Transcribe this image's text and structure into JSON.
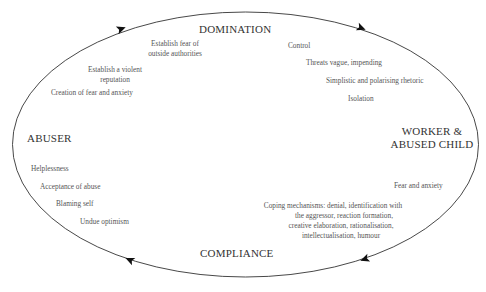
{
  "diagram": {
    "nodes": {
      "domination": "DOMINATION",
      "abuser": "ABUSER",
      "worker": [
        "WORKER &",
        "ABUSED CHILD"
      ],
      "compliance": "COMPLIANCE"
    },
    "abuser_domination_items": [
      [
        "Establish fear of",
        "outside authorities"
      ],
      [
        "Establish a violent",
        "reputation"
      ],
      [
        "Creation of fear and anxiety"
      ]
    ],
    "domination_worker_items": [
      "Control",
      "Threats vague, impending",
      "Simplistic and polarising rhetoric",
      "Isolation"
    ],
    "worker_compliance_items": [
      [
        "Fear and anxiety"
      ],
      [
        "Coping mechanisms: denial, identification with",
        "the aggressor, reaction formation,",
        "creative elaboration, rationalisation,",
        "intellectualisation, humour"
      ]
    ],
    "compliance_abuser_items": [
      "Helplessness",
      "Acceptance of abuse",
      "Blaming self",
      "Undue optimism"
    ],
    "cycle_direction": "clockwise",
    "line_color": "#333333",
    "text_color": "#555555"
  }
}
